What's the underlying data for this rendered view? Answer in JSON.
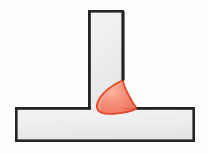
{
  "diagram": {
    "title": "T-joint fillet weld cross-section",
    "type": "technical-illustration",
    "canvas": {
      "width": 208,
      "height": 154,
      "background_color": "#FDFDFB"
    },
    "style": {
      "plate_fill_color": "#EDEFEE",
      "plate_fill_color_shade": "#E2E5E4",
      "plate_outline_color": "#242424",
      "plate_outline_width": 2.6,
      "weld_fill_color": "#F2836F",
      "weld_fill_highlight": "#F9A894",
      "weld_outline_color": "#E04A2E",
      "weld_outline_width": 1.8
    },
    "parts": [
      {
        "id": "vertical-plate",
        "label": "Vertical member (web)",
        "shape": "rectangle",
        "x": 88,
        "y": 10,
        "width": 36,
        "height": 98
      },
      {
        "id": "horizontal-plate",
        "label": "Horizontal member (base plate)",
        "shape": "rectangle",
        "x": 15,
        "y": 107,
        "width": 180,
        "height": 35
      },
      {
        "id": "fillet-weld",
        "label": "Fillet weld bead",
        "shape": "fillet",
        "leg_vertical_top_y": 80,
        "leg_horizontal_right_x": 137,
        "root_x": 124,
        "root_y": 107,
        "toe_drop_y": 113
      }
    ]
  }
}
